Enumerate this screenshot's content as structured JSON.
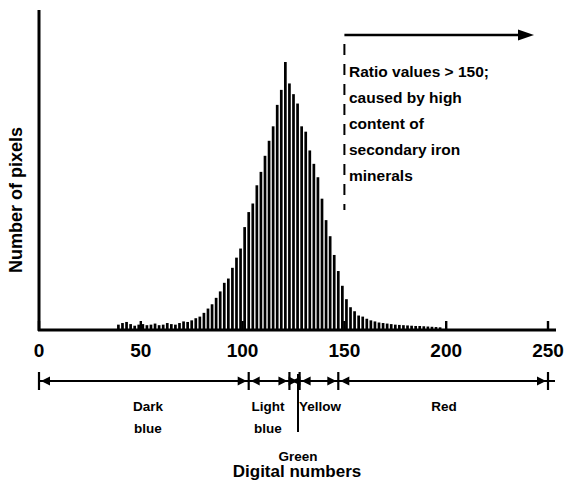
{
  "chart_data": {
    "type": "bar",
    "title": "",
    "xlabel": "Digital numbers",
    "ylabel": "Number of pixels",
    "xlim": [
      0,
      257
    ],
    "ylim": [
      0,
      100
    ],
    "grid": false,
    "legend": null,
    "x_ticks": [
      "0",
      "50",
      "100",
      "150",
      "200",
      "250"
    ],
    "x_tick_values": [
      0,
      50,
      100,
      150,
      200,
      250
    ],
    "y_ticks": [],
    "bar_step": 2,
    "x": [
      39,
      41,
      43,
      45,
      47,
      49,
      51,
      53,
      55,
      57,
      59,
      61,
      63,
      65,
      67,
      69,
      71,
      73,
      75,
      77,
      79,
      81,
      83,
      85,
      87,
      89,
      91,
      93,
      95,
      97,
      99,
      101,
      103,
      105,
      107,
      109,
      111,
      113,
      115,
      117,
      119,
      121,
      123,
      125,
      127,
      129,
      131,
      133,
      135,
      137,
      139,
      141,
      143,
      145,
      147,
      149,
      151,
      153,
      155,
      157,
      159,
      161,
      163,
      165,
      167,
      169,
      171,
      173,
      175,
      177,
      179,
      181,
      183,
      185,
      187,
      189,
      191,
      193,
      195,
      197
    ],
    "values": [
      2.0,
      2.6,
      3.0,
      2.2,
      1.6,
      2.0,
      2.2,
      1.8,
      2.0,
      2.4,
      1.8,
      2.0,
      2.6,
      2.2,
      2.0,
      2.6,
      3.2,
      3.0,
      3.6,
      4.4,
      5.0,
      6.4,
      8.0,
      9.6,
      12.0,
      14.4,
      17.6,
      19.2,
      23.2,
      27.0,
      30.4,
      38.4,
      44.0,
      47.2,
      54.0,
      59.0,
      65.0,
      70.6,
      76.0,
      84.0,
      89.6,
      100.0,
      92.0,
      88.0,
      84.5,
      76.0,
      74.0,
      67.0,
      62.0,
      57.0,
      49.0,
      41.0,
      35.0,
      28.0,
      22.0,
      16.5,
      11.5,
      8.5,
      7.0,
      5.4,
      5.0,
      4.2,
      3.6,
      3.2,
      2.8,
      2.6,
      2.4,
      2.2,
      2.0,
      1.9,
      1.8,
      1.7,
      1.6,
      1.5,
      1.5,
      1.4,
      1.3,
      1.2,
      1.1,
      1.0
    ],
    "annotation": {
      "threshold_value": 150,
      "marker_style": "dashed-vertical-line-with-arrow",
      "arrow_direction": "right",
      "lines": [
        "Ratio values > 150;",
        "caused by high",
        "content of",
        "secondary iron",
        "minerals"
      ]
    },
    "color_bands": [
      {
        "label": "Dark blue",
        "label_lines": [
          "Dark",
          "blue"
        ],
        "start": 0,
        "end": 103
      },
      {
        "label": "Light blue",
        "label_lines": [
          "Light",
          "blue"
        ],
        "start": 103,
        "end": 123
      },
      {
        "label": "Green",
        "label_lines": [
          "Green"
        ],
        "start": 123,
        "end": 128
      },
      {
        "label": "Yellow",
        "label_lines": [
          "Yellow"
        ],
        "start": 128,
        "end": 147
      },
      {
        "label": "Red",
        "label_lines": [
          "Red"
        ],
        "start": 147,
        "end": 250
      }
    ],
    "colors": {
      "ink": "#000000",
      "background": "#ffffff"
    }
  }
}
